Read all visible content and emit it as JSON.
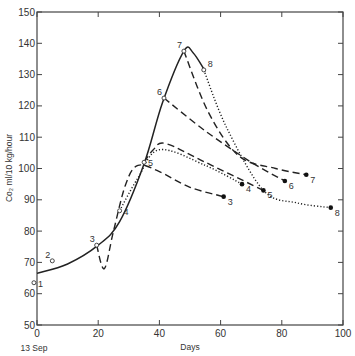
{
  "chart_data": {
    "type": "line",
    "title": "",
    "xlabel": "Days",
    "ylabel": "Co₂ ml/10 kg/hour",
    "x_start_label": "13 Sep",
    "xlim": [
      0,
      100
    ],
    "ylim": [
      50,
      150
    ],
    "xticks": [
      0,
      20,
      40,
      60,
      80,
      100
    ],
    "yticks": [
      50,
      60,
      70,
      80,
      90,
      100,
      110,
      120,
      130,
      140,
      150
    ],
    "grid": false,
    "main_curve": {
      "name": "on tree",
      "style": "solid",
      "points": [
        [
          0,
          66.5
        ],
        [
          10,
          69.5
        ],
        [
          20,
          75.5
        ],
        [
          27,
          83
        ],
        [
          35,
          101.5
        ],
        [
          41,
          121
        ],
        [
          48,
          137.5
        ],
        [
          51,
          137
        ],
        [
          55,
          131
        ]
      ]
    },
    "picking_points": [
      {
        "label": "1",
        "x": -1,
        "y": 63.5
      },
      {
        "label": "2",
        "x": 5,
        "y": 70.5
      },
      {
        "label": "3",
        "x": 19.5,
        "y": 75.5
      },
      {
        "label": "4",
        "x": 27,
        "y": 86.5
      },
      {
        "label": "5",
        "x": 35,
        "y": 102
      },
      {
        "label": "6",
        "x": 41.5,
        "y": 122.5
      },
      {
        "label": "7",
        "x": 48,
        "y": 137.5
      },
      {
        "label": "8",
        "x": 54.5,
        "y": 131.5
      }
    ],
    "series": [
      {
        "name": "3",
        "style": "dashed",
        "points": [
          [
            19.5,
            75.5
          ],
          [
            22,
            68
          ],
          [
            25,
            80
          ],
          [
            29,
            95
          ],
          [
            33,
            101
          ],
          [
            40,
            99
          ],
          [
            50,
            94
          ],
          [
            61,
            91
          ]
        ],
        "end": {
          "x": 61,
          "y": 91
        }
      },
      {
        "name": "4",
        "style": "dotted",
        "points": [
          [
            27,
            86.5
          ],
          [
            33,
            97
          ],
          [
            40,
            106
          ],
          [
            55,
            101
          ],
          [
            67,
            95
          ]
        ],
        "end": {
          "x": 67,
          "y": 95
        }
      },
      {
        "name": "5",
        "style": "dashed",
        "points": [
          [
            35,
            102
          ],
          [
            38,
            106
          ],
          [
            42,
            108
          ],
          [
            55,
            102
          ],
          [
            74,
            93
          ]
        ],
        "end": {
          "x": 74,
          "y": 93
        }
      },
      {
        "name": "6",
        "style": "dashed",
        "points": [
          [
            41.5,
            122.5
          ],
          [
            55,
            112
          ],
          [
            70,
            102
          ],
          [
            81,
            96
          ]
        ],
        "end": {
          "x": 81,
          "y": 96
        }
      },
      {
        "name": "7",
        "style": "dashed",
        "points": [
          [
            48,
            137.5
          ],
          [
            56,
            118
          ],
          [
            66,
            104
          ],
          [
            78,
            100
          ],
          [
            88,
            98
          ]
        ],
        "end": {
          "x": 88,
          "y": 98
        }
      },
      {
        "name": "8",
        "style": "dotted",
        "points": [
          [
            54.5,
            131.5
          ],
          [
            62,
            113
          ],
          [
            74,
            93
          ],
          [
            85,
            89
          ],
          [
            96,
            87.5
          ]
        ],
        "end": {
          "x": 96,
          "y": 87.5
        }
      }
    ]
  }
}
